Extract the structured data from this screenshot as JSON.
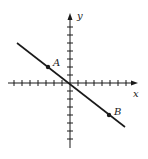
{
  "diagram": {
    "type": "coordinate-plane-line",
    "axes": {
      "x_label": "x",
      "y_label": "y",
      "tick_spacing_px": 8,
      "x_ticks_left": 7,
      "x_ticks_right": 7,
      "y_ticks_up": 7,
      "y_ticks_down": 7
    },
    "line": {
      "passes_through_origin": true,
      "slope_direction": "negative"
    },
    "points": [
      {
        "label": "A",
        "grid_x": -3,
        "grid_y": 2
      },
      {
        "label": "B",
        "grid_x": 5,
        "grid_y": -4
      }
    ],
    "colors": {
      "ink": "#1a1a1a",
      "background": "#ffffff"
    }
  }
}
